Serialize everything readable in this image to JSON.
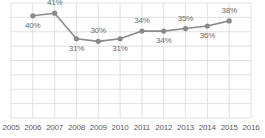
{
  "chart_data": {
    "type": "line",
    "title": "",
    "xlabel": "",
    "ylabel": "",
    "grid": true,
    "legend": false,
    "x_tick_labels": [
      "2005",
      "2006",
      "2007",
      "2008",
      "2009",
      "2010",
      "2011",
      "2012",
      "2013",
      "2014",
      "2015",
      "2016"
    ],
    "x": [
      2006,
      2007,
      2008,
      2009,
      2010,
      2011,
      2012,
      2013,
      2014,
      2015
    ],
    "values": [
      40,
      41,
      31,
      30,
      31,
      34,
      34,
      35,
      36,
      38
    ],
    "point_labels": [
      "40%",
      "41%",
      "31%",
      "30%",
      "31%",
      "34%",
      "34%",
      "35%",
      "36%",
      "38%"
    ],
    "label_positions": [
      "below",
      "above",
      "below",
      "above",
      "below",
      "above",
      "below",
      "above",
      "below",
      "above"
    ],
    "ylim": [
      0,
      45
    ],
    "y_axis_visible": false,
    "series_color": "#8a8a8a",
    "marker_color": "#8a8a8a",
    "grid_color": "#d9d9d9",
    "label_color": "#6b6b6b",
    "tick_color": "#5a5a5a",
    "background": "#ffffff"
  }
}
